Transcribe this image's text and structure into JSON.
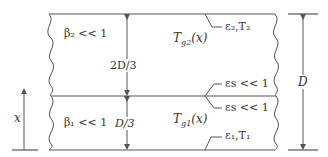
{
  "diagram": {
    "type": "two-layer gas slab between parallel plates",
    "colors": {
      "line": "#555555",
      "text": "#333333",
      "background": "#ffffff"
    },
    "upper_layer": {
      "beta_label": "β₂ << 1",
      "thickness_label": "2D/3",
      "temperature_label": "T_g2(x)",
      "temperature_main": "T",
      "temperature_sub": "g2",
      "temperature_arg": "(x)",
      "top_wall_label": "ε₂,T₂"
    },
    "lower_layer": {
      "beta_label": "β₁ << 1",
      "thickness_label": "D/3",
      "temperature_label": "T_g1(x)",
      "temperature_main": "T",
      "temperature_sub": "g1",
      "temperature_arg": "(x)",
      "bottom_wall_label": "ε₁,T₁"
    },
    "interface": {
      "upper_label": "εs << 1",
      "lower_label": "εs << 1"
    },
    "total_thickness_label": "D",
    "coordinate_label": "x"
  }
}
